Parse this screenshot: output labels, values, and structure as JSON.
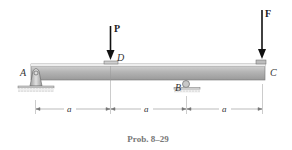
{
  "diagram": {
    "type": "beam",
    "labels": {
      "A": "A",
      "B": "B",
      "C": "C",
      "D": "D"
    },
    "loads": [
      {
        "name": "P",
        "label": "P",
        "at": "D"
      },
      {
        "name": "F",
        "label": "F",
        "at": "C"
      }
    ],
    "supports": [
      {
        "point": "A",
        "type": "pin"
      },
      {
        "point": "B",
        "type": "roller"
      }
    ],
    "dimensions": [
      {
        "label": "a",
        "from": "A",
        "to": "D"
      },
      {
        "label": "a",
        "from": "D",
        "to": "B"
      },
      {
        "label": "a",
        "from": "B",
        "to": "C"
      }
    ],
    "caption": "Prob. 8–29",
    "colors": {
      "beam_top": "#e6e6e6",
      "beam_body": "#a8a8a8",
      "arrow": "#111111",
      "caption": "#777777"
    }
  }
}
